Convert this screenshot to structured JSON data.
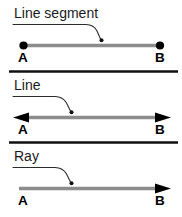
{
  "diagram": {
    "type": "geometry-definitions",
    "width": 182,
    "height": 217,
    "background_color": "#ffffff",
    "line_color": "#8c8c8c",
    "ink_color": "#000000",
    "divider_color": "#101010",
    "panels": [
      {
        "id": "line-segment",
        "label": "Line segment",
        "start_label": "A",
        "end_label": "B",
        "start_marker": "dot",
        "end_marker": "dot",
        "leader": "callout pointing to the middle of the segment"
      },
      {
        "id": "line",
        "label": "Line",
        "start_label": "A",
        "end_label": "B",
        "start_marker": "arrow",
        "end_marker": "arrow",
        "leader": "callout pointing to the middle of the line"
      },
      {
        "id": "ray",
        "label": "Ray",
        "start_label": "A",
        "end_label": "B",
        "start_marker": "flat",
        "end_marker": "arrow",
        "leader": "callout pointing to the middle of the ray"
      }
    ],
    "dividers": 2
  }
}
